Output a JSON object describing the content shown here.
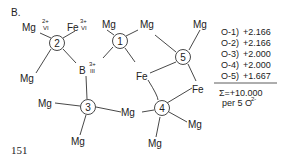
{
  "panel_label": "B.",
  "page_number": "151",
  "centers": [
    {
      "id": "1",
      "label": "1"
    },
    {
      "id": "2",
      "label": "2"
    },
    {
      "id": "3",
      "label": "3"
    },
    {
      "id": "4",
      "label": "4"
    },
    {
      "id": "5",
      "label": "5"
    }
  ],
  "atoms": {
    "mg": "Mg",
    "fe": "Fe",
    "b": "B"
  },
  "superscripts": {
    "mg2_charge": "2+",
    "mg2_coord": "VI",
    "fe3_charge": "3+",
    "fe3_coord": "VI",
    "b3_charge": "3+",
    "b3_coord": "III"
  },
  "bond_sums": [
    {
      "label": "O-1)",
      "value": "+2.166"
    },
    {
      "label": "O-2)",
      "value": "+2.166"
    },
    {
      "label": "O-3)",
      "value": "+2.000"
    },
    {
      "label": "O-4)",
      "value": "+2.000"
    },
    {
      "label": "O-5)",
      "value": "+1.667"
    }
  ],
  "total": "Σ=+10.000",
  "per_note": "per 5 O",
  "per_note_sup": "2-"
}
